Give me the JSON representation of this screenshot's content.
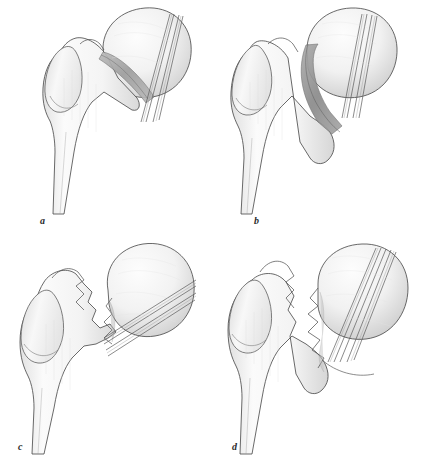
{
  "figure": {
    "caption_labels": [
      "a",
      "b",
      "c",
      "d"
    ],
    "background_color": "#ffffff",
    "ink_color": "#3a3a3a",
    "shade_light": "#f0f0f0",
    "shade_mid": "#d8d8d8",
    "shade_dark": "#a8a8a8",
    "fracture_color": "#9a9a9a"
  },
  "panels": [
    {
      "id": "a",
      "label": "a",
      "fracture_type": "impacted-valgus-undisplaced",
      "screw_count": 3,
      "screw_orientation": "near-vertical-oblique",
      "head_position": "anatomic"
    },
    {
      "id": "b",
      "label": "b",
      "fracture_type": "complete-undisplaced",
      "screw_count": 3,
      "screw_orientation": "vertical",
      "head_position": "anatomic"
    },
    {
      "id": "c",
      "label": "c",
      "fracture_type": "complete-partially-displaced",
      "screw_count": 3,
      "screw_orientation": "diagonal-upward-lateral",
      "head_position": "displaced-lateral"
    },
    {
      "id": "d",
      "label": "d",
      "fracture_type": "complete-fully-displaced",
      "screw_count": 4,
      "screw_orientation": "steep-oblique",
      "head_position": "rotated-displaced"
    }
  ]
}
